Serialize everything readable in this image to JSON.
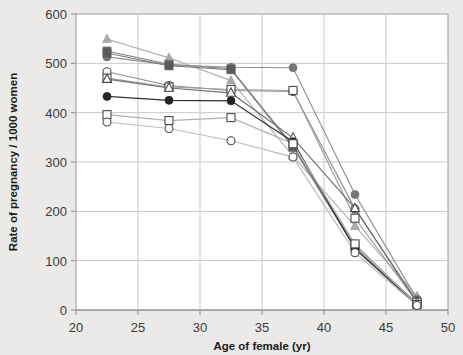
{
  "figure": {
    "background_color": "#eceae8",
    "plot_background_color": "#ffffff",
    "frame_color": "#9a9a9a",
    "grid_color": "#c9c9c9"
  },
  "chart_data": {
    "type": "line",
    "title": "",
    "subtitle": "",
    "xlabel": "Age of female (yr)",
    "ylabel": "Rate of pregnancy / 1000 women",
    "xlim": [
      20,
      50
    ],
    "ylim": [
      0,
      600
    ],
    "xticks": [
      20,
      25,
      30,
      35,
      40,
      45,
      50
    ],
    "xtick_labels": [
      "20",
      "25",
      "30",
      "35",
      "40",
      "45",
      "50"
    ],
    "yticks": [
      0,
      100,
      200,
      300,
      400,
      500,
      600
    ],
    "ytick_labels": [
      "0",
      "100",
      "200",
      "300",
      "400",
      "500",
      "600"
    ],
    "grid": "both",
    "legend": "none",
    "x": [
      22.5,
      27.5,
      32.5,
      37.5,
      42.5,
      47.5
    ],
    "series": [
      {
        "name": "series-1",
        "marker": "triangle-filled",
        "color": "#a9a9a9",
        "line_color": "#b4b4b4",
        "values": [
          549,
          511,
          465,
          312,
          170,
          28
        ]
      },
      {
        "name": "series-2",
        "marker": "square-filled",
        "color": "#6e6e6e",
        "line_color": "#8a8a8a",
        "values": [
          525,
          498,
          489,
          333,
          130,
          14
        ]
      },
      {
        "name": "series-3",
        "marker": "circle-filled-gray",
        "color": "#767676",
        "line_color": "#8f8f8f",
        "values": [
          513,
          497,
          492,
          491,
          234,
          22
        ]
      },
      {
        "name": "series-4",
        "marker": "square-filled-dark",
        "color": "#5a5a5a",
        "line_color": "#7a7a7a",
        "values": [
          521,
          495,
          487,
          330,
          126,
          12
        ]
      },
      {
        "name": "series-5",
        "marker": "circle-open",
        "color": "#ffffff",
        "line_color": "#909090",
        "values": [
          483,
          455,
          445,
          443,
          205,
          18
        ]
      },
      {
        "name": "series-6",
        "marker": "square-open",
        "color": "#ffffff",
        "line_color": "#9b9b9b",
        "values": [
          470,
          452,
          447,
          445,
          186,
          16
        ]
      },
      {
        "name": "series-7",
        "marker": "triangle-open",
        "color": "#ffffff",
        "line_color": "#6f6f6f",
        "values": [
          468,
          450,
          440,
          349,
          206,
          15
        ]
      },
      {
        "name": "series-8",
        "marker": "circle-filled-black",
        "color": "#242424",
        "line_color": "#2f2f2f",
        "values": [
          433,
          425,
          424,
          341,
          124,
          10
        ]
      },
      {
        "name": "series-9",
        "marker": "square-open-light",
        "color": "#ffffff",
        "line_color": "#b0b0b0",
        "values": [
          396,
          384,
          390,
          337,
          134,
          11
        ]
      },
      {
        "name": "series-10",
        "marker": "circle-open-light",
        "color": "#ffffff",
        "line_color": "#bdbdbd",
        "values": [
          381,
          368,
          343,
          310,
          116,
          9
        ]
      }
    ]
  }
}
